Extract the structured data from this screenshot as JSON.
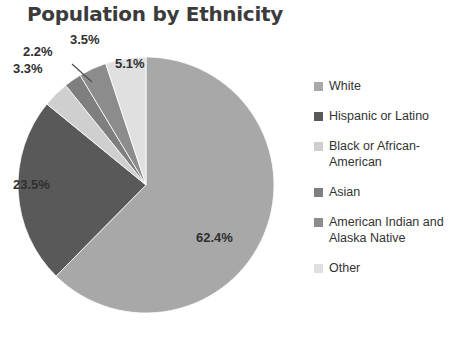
{
  "chart": {
    "title": "Population by Ethnicity"
  },
  "chart_data": {
    "type": "pie",
    "title": "Population by Ethnicity",
    "xlabel": "",
    "ylabel": "",
    "legend_position": "right",
    "grid": false,
    "categories": [
      "White",
      "Hispanic or Latino",
      "Black or African-American",
      "Asian",
      "American Indian and Alaska Native",
      "Other"
    ],
    "values": [
      62.4,
      23.5,
      3.3,
      2.2,
      3.5,
      5.1
    ],
    "value_labels": [
      "62.4%",
      "23.5%",
      "3.3%",
      "2.2%",
      "3.5%",
      "5.1%"
    ],
    "colors": [
      "#a8a8a8",
      "#595959",
      "#cfcfcf",
      "#7f7f7f",
      "#8c8c8c",
      "#e0e0e0"
    ],
    "start_angle_deg": 0,
    "direction": "clockwise",
    "units": "percent"
  },
  "slices": [
    {
      "name": "White",
      "label": "62.4%",
      "value": 62.4,
      "color": "#a8a8a8"
    },
    {
      "name": "Hispanic or Latino",
      "label": "23.5%",
      "value": 23.5,
      "color": "#595959"
    },
    {
      "name": "Black or African-American",
      "label": "3.3%",
      "value": 3.3,
      "color": "#cfcfcf"
    },
    {
      "name": "Asian",
      "label": "2.2%",
      "value": 2.2,
      "color": "#7f7f7f"
    },
    {
      "name": "American Indian and Alaska Native",
      "label": "3.5%",
      "value": 3.5,
      "color": "#8c8c8c"
    },
    {
      "name": "Other",
      "label": "5.1%",
      "value": 5.1,
      "color": "#e0e0e0"
    }
  ],
  "legend": {
    "items": [
      {
        "label": "White",
        "color": "#a8a8a8"
      },
      {
        "label": "Hispanic or Latino",
        "color": "#595959"
      },
      {
        "label": "Black or African-American",
        "color": "#cfcfcf"
      },
      {
        "label": "Asian",
        "color": "#7f7f7f"
      },
      {
        "label": "American Indian and Alaska Native",
        "color": "#8c8c8c"
      },
      {
        "label": "Other",
        "color": "#e0e0e0"
      }
    ]
  },
  "labels": {
    "white": "62.4%",
    "hispanic": "23.5%",
    "black": "3.3%",
    "asian": "2.2%",
    "american_indian": "3.5%",
    "other": "5.1%"
  }
}
